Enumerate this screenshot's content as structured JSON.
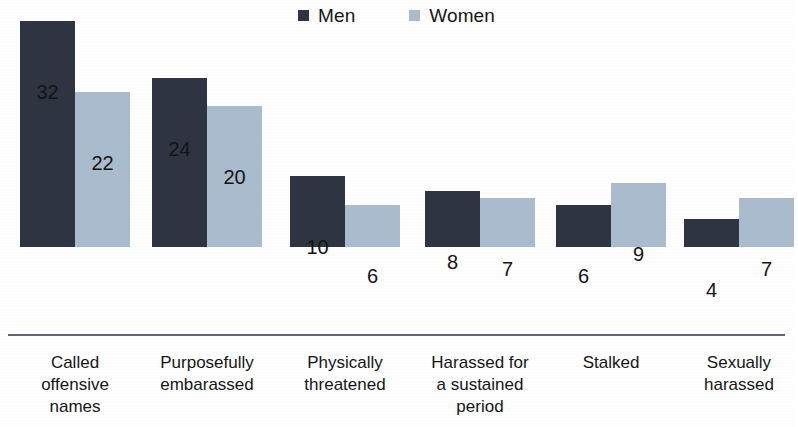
{
  "legend": {
    "position": "top-center",
    "entries": [
      {
        "label": "Men",
        "color": "#2e3442",
        "icon": "square-swatch-icon"
      },
      {
        "label": "Women",
        "color": "#a9bccd",
        "icon": "square-swatch-icon"
      }
    ]
  },
  "chart_data": {
    "type": "bar",
    "title": "",
    "subtitle": "",
    "xlabel": "",
    "ylabel": "",
    "grid": false,
    "legend_position": "top-center",
    "ylim": [
      0,
      34
    ],
    "axis_baseline": 0,
    "value_labels": true,
    "value_unit": "%",
    "categories": [
      "Called offensive names",
      "Purposefully embarassed",
      "Physically threatened",
      "Harassed for a sustained period",
      "Stalked",
      "Sexually harassed"
    ],
    "category_lines": [
      [
        "Called",
        "offensive",
        "names"
      ],
      [
        "Purposefully",
        "embarassed"
      ],
      [
        "Physically",
        "threatened"
      ],
      [
        "Harassed for",
        "a sustained",
        "period"
      ],
      [
        "Stalked"
      ],
      [
        "Sexually",
        "harassed"
      ]
    ],
    "series": [
      {
        "name": "Men",
        "color": "#2e3442",
        "values": [
          32,
          24,
          10,
          8,
          6,
          4
        ]
      },
      {
        "name": "Women",
        "color": "#a9bccd",
        "values": [
          22,
          20,
          6,
          7,
          9,
          7
        ]
      }
    ]
  },
  "geometry": {
    "baseline_y": 334,
    "px_per_unit": 7.06,
    "bar_width": 55,
    "group_starts": [
      20,
      152,
      290,
      425,
      556,
      684
    ],
    "bar_gap": 0
  }
}
